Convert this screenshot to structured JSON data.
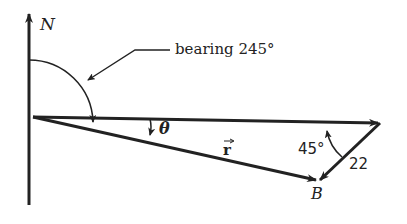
{
  "diagram": {
    "labels": {
      "north": "N",
      "bearing": "bearing 245°",
      "theta": "θ",
      "r_vector": "r",
      "angle_45": "45°",
      "length_22": "22",
      "point_b": "B"
    },
    "colors": {
      "stroke": "#222222",
      "background": "#ffffff"
    }
  }
}
